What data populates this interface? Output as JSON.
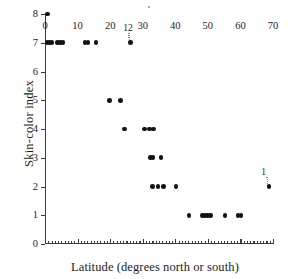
{
  "chart_data": {
    "type": "scatter",
    "title": "",
    "xlabel": "Latitude (degrees north or south)",
    "ylabel": "Skin-color index",
    "xlim": [
      0,
      70
    ],
    "ylim": [
      0,
      8
    ],
    "xticks": [
      0,
      10,
      20,
      30,
      40,
      50,
      60,
      70
    ],
    "xtick_labels": [
      "0",
      "10",
      "20",
      "30",
      "40",
      "50",
      "60",
      "70"
    ],
    "yticks": [
      0,
      1,
      2,
      3,
      4,
      5,
      6,
      7,
      8
    ],
    "ytick_labels": [
      "0",
      "1",
      "2",
      "3",
      "4",
      "5",
      "6",
      "7",
      "8"
    ],
    "xminor_step": 1,
    "grid": false,
    "legend": null,
    "marker": "filled-circle",
    "marker_color": "#121212",
    "axis_color": "#3b3b3b",
    "points": [
      {
        "x": 0.8,
        "y": 8
      },
      {
        "x": 0.6,
        "y": 7
      },
      {
        "x": 1.4,
        "y": 7
      },
      {
        "x": 2.2,
        "y": 7
      },
      {
        "x": 3.9,
        "y": 7
      },
      {
        "x": 4.7,
        "y": 7
      },
      {
        "x": 5.5,
        "y": 7
      },
      {
        "x": 12.3,
        "y": 7
      },
      {
        "x": 13.2,
        "y": 7
      },
      {
        "x": 15.6,
        "y": 7
      },
      {
        "x": 26.3,
        "y": 7
      },
      {
        "x": 19.8,
        "y": 5
      },
      {
        "x": 23.1,
        "y": 5
      },
      {
        "x": 24.4,
        "y": 4
      },
      {
        "x": 30.6,
        "y": 4
      },
      {
        "x": 32.0,
        "y": 4
      },
      {
        "x": 33.3,
        "y": 4
      },
      {
        "x": 32.3,
        "y": 3
      },
      {
        "x": 33.2,
        "y": 3
      },
      {
        "x": 35.6,
        "y": 3
      },
      {
        "x": 33.0,
        "y": 2
      },
      {
        "x": 34.7,
        "y": 2
      },
      {
        "x": 36.4,
        "y": 2
      },
      {
        "x": 40.2,
        "y": 2
      },
      {
        "x": 68.8,
        "y": 2
      },
      {
        "x": 44.2,
        "y": 1
      },
      {
        "x": 48.3,
        "y": 1
      },
      {
        "x": 49.1,
        "y": 1
      },
      {
        "x": 49.9,
        "y": 1
      },
      {
        "x": 50.8,
        "y": 1
      },
      {
        "x": 55.3,
        "y": 1
      },
      {
        "x": 59.3,
        "y": 1
      },
      {
        "x": 60.2,
        "y": 1
      }
    ],
    "annotations": [
      {
        "text": "12",
        "x": 24.0,
        "y": 7.45,
        "points_to": {
          "x": 26.3,
          "y": 7
        }
      },
      {
        "text": "1",
        "x": 66.4,
        "y": 2.45,
        "points_to": {
          "x": 68.8,
          "y": 2
        }
      }
    ]
  }
}
